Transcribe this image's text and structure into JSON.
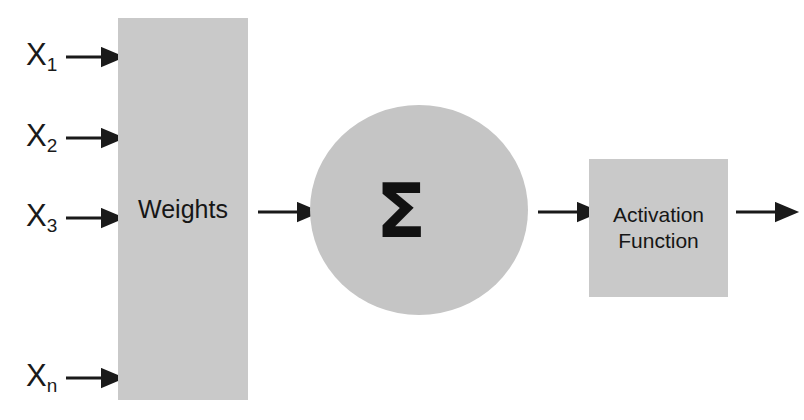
{
  "diagram": {
    "type": "neural-network-neuron",
    "colors": {
      "shape_fill": "#c9c9c9",
      "circle_fill": "#c5c5c5",
      "stroke": "#1a1a1a",
      "background": "#ffffff"
    },
    "inputs": [
      {
        "base": "X",
        "subscript": "1",
        "text": "X1",
        "y": 57
      },
      {
        "base": "X",
        "subscript": "2",
        "text": "X2",
        "y": 138
      },
      {
        "base": "X",
        "subscript": "3",
        "text": "X3",
        "y": 218
      },
      {
        "base": "X",
        "subscript": "n",
        "text": "Xn",
        "y": 378
      }
    ],
    "weights_block": {
      "label": "Weights"
    },
    "summation_node": {
      "symbol": "Σ",
      "symbol_name": "sigma-summation"
    },
    "activation_block": {
      "line1": "Activation",
      "line2": "Function"
    },
    "arrows": [
      {
        "name": "input-arrow-1",
        "from": "X1",
        "to": "weights"
      },
      {
        "name": "input-arrow-2",
        "from": "X2",
        "to": "weights"
      },
      {
        "name": "input-arrow-3",
        "from": "X3",
        "to": "weights"
      },
      {
        "name": "input-arrow-n",
        "from": "Xn",
        "to": "weights"
      },
      {
        "name": "weights-to-sum-arrow",
        "from": "weights",
        "to": "summation"
      },
      {
        "name": "sum-to-activation-arrow",
        "from": "summation",
        "to": "activation"
      },
      {
        "name": "activation-output-arrow",
        "from": "activation",
        "to": "output"
      }
    ]
  }
}
